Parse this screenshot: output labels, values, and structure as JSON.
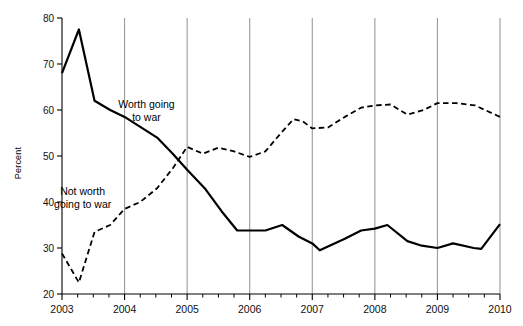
{
  "chart_data": {
    "type": "line",
    "title": "",
    "xlabel": "",
    "ylabel": "Percent",
    "ylim": [
      20,
      80
    ],
    "xlim": [
      2003.0,
      2010.0
    ],
    "yticks": [
      20,
      30,
      40,
      50,
      60,
      70,
      80
    ],
    "ytick_labels": [
      "20",
      "30",
      "40",
      "50",
      "60",
      "70",
      "80"
    ],
    "xticks": [
      2003,
      2004,
      2005,
      2006,
      2007,
      2008,
      2009,
      2010
    ],
    "xtick_labels": [
      "2003",
      "2004",
      "2005",
      "2006",
      "2007",
      "2008",
      "2009",
      "2010"
    ],
    "minor_xticks_per_year": 4,
    "grid": "vertical-year-lines",
    "grid_color": "#9a9a9a",
    "legend": "inline-annotations",
    "series": [
      {
        "name": "Worth going to war",
        "style": "solid",
        "color": "#000000",
        "label_position": {
          "x": 2004.35,
          "y": 60.5
        },
        "points": [
          {
            "x": 2003.0,
            "y": 68.0
          },
          {
            "x": 2003.27,
            "y": 77.5
          },
          {
            "x": 2003.52,
            "y": 62.0
          },
          {
            "x": 2003.77,
            "y": 60.0
          },
          {
            "x": 2004.0,
            "y": 58.5
          },
          {
            "x": 2004.52,
            "y": 54.0
          },
          {
            "x": 2004.77,
            "y": 50.5
          },
          {
            "x": 2005.0,
            "y": 47.0
          },
          {
            "x": 2005.28,
            "y": 43.0
          },
          {
            "x": 2005.55,
            "y": 38.0
          },
          {
            "x": 2005.8,
            "y": 33.8
          },
          {
            "x": 2006.0,
            "y": 33.8
          },
          {
            "x": 2006.25,
            "y": 33.8
          },
          {
            "x": 2006.52,
            "y": 35.0
          },
          {
            "x": 2006.78,
            "y": 32.5
          },
          {
            "x": 2007.0,
            "y": 31.0
          },
          {
            "x": 2007.12,
            "y": 29.5
          },
          {
            "x": 2007.52,
            "y": 32.0
          },
          {
            "x": 2007.78,
            "y": 33.8
          },
          {
            "x": 2008.0,
            "y": 34.2
          },
          {
            "x": 2008.2,
            "y": 35.0
          },
          {
            "x": 2008.52,
            "y": 31.5
          },
          {
            "x": 2008.75,
            "y": 30.5
          },
          {
            "x": 2009.0,
            "y": 30.0
          },
          {
            "x": 2009.25,
            "y": 31.0
          },
          {
            "x": 2009.58,
            "y": 30.0
          },
          {
            "x": 2009.7,
            "y": 29.8
          },
          {
            "x": 2010.0,
            "y": 35.2
          }
        ]
      },
      {
        "name": "Not worth going to war",
        "style": "dashed",
        "color": "#000000",
        "label_position": {
          "x": 2003.35,
          "y": 41.0
        },
        "points": [
          {
            "x": 2003.0,
            "y": 28.8
          },
          {
            "x": 2003.27,
            "y": 22.5
          },
          {
            "x": 2003.52,
            "y": 33.5
          },
          {
            "x": 2003.77,
            "y": 35.0
          },
          {
            "x": 2004.0,
            "y": 38.5
          },
          {
            "x": 2004.25,
            "y": 40.0
          },
          {
            "x": 2004.52,
            "y": 43.0
          },
          {
            "x": 2004.78,
            "y": 47.5
          },
          {
            "x": 2005.0,
            "y": 52.0
          },
          {
            "x": 2005.25,
            "y": 50.5
          },
          {
            "x": 2005.5,
            "y": 51.8
          },
          {
            "x": 2005.75,
            "y": 51.0
          },
          {
            "x": 2006.0,
            "y": 49.8
          },
          {
            "x": 2006.25,
            "y": 51.0
          },
          {
            "x": 2006.5,
            "y": 55.0
          },
          {
            "x": 2006.7,
            "y": 58.0
          },
          {
            "x": 2006.85,
            "y": 57.5
          },
          {
            "x": 2007.0,
            "y": 56.0
          },
          {
            "x": 2007.25,
            "y": 56.2
          },
          {
            "x": 2007.52,
            "y": 58.5
          },
          {
            "x": 2007.78,
            "y": 60.5
          },
          {
            "x": 2008.0,
            "y": 61.0
          },
          {
            "x": 2008.25,
            "y": 61.2
          },
          {
            "x": 2008.52,
            "y": 59.0
          },
          {
            "x": 2008.78,
            "y": 60.0
          },
          {
            "x": 2009.0,
            "y": 61.5
          },
          {
            "x": 2009.3,
            "y": 61.5
          },
          {
            "x": 2009.6,
            "y": 61.0
          },
          {
            "x": 2010.0,
            "y": 58.5
          }
        ]
      }
    ],
    "annotations": [
      {
        "id": "worth-label",
        "lines": [
          "Worth going",
          "to war"
        ],
        "x": 2004.35,
        "y": 60.5
      },
      {
        "id": "not-worth-label",
        "lines": [
          "Not worth",
          "going to war"
        ],
        "x": 2003.33,
        "y": 41.5
      }
    ]
  }
}
